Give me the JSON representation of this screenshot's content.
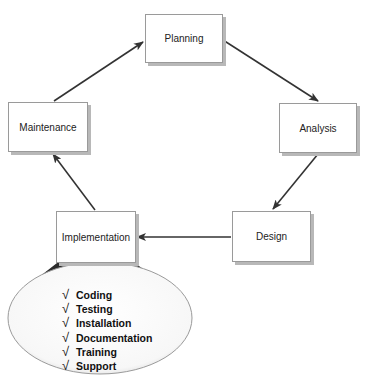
{
  "diagram": {
    "phases": [
      {
        "id": "planning",
        "label": "Planning"
      },
      {
        "id": "analysis",
        "label": "Analysis"
      },
      {
        "id": "design",
        "label": "Design"
      },
      {
        "id": "implementation",
        "label": "Implementation"
      },
      {
        "id": "maintenance",
        "label": "Maintenance"
      }
    ],
    "edges": [
      {
        "from": "planning",
        "to": "analysis"
      },
      {
        "from": "analysis",
        "to": "design"
      },
      {
        "from": "design",
        "to": "implementation"
      },
      {
        "from": "implementation",
        "to": "maintenance"
      },
      {
        "from": "maintenance",
        "to": "planning"
      }
    ],
    "implementation_details": {
      "icon": "checkmark-icon",
      "check_glyph": "√",
      "items": [
        "Coding",
        "Testing",
        "Installation",
        "Documentation",
        "Training",
        "Support"
      ]
    },
    "colors": {
      "arrow": "#333333",
      "box_border": "#9a9a9a",
      "box_shadow": "#b8b8b8",
      "funnel": "#2b2b2b",
      "ellipse_border": "#9a9a9a"
    }
  }
}
